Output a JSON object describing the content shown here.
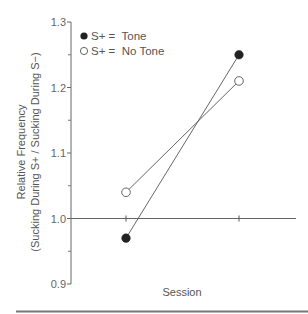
{
  "chart_data": {
    "type": "line",
    "title": "",
    "xlabel": "Session",
    "ylabel": "Relative Frequency",
    "ylabel_sub": "(Sucking During S+ / Sucking During S−)",
    "ylim": [
      0.9,
      1.3
    ],
    "yticks": [
      "0.9",
      "1.0",
      "1.1",
      "1.2",
      "1.3"
    ],
    "y_minor_ticks": [
      0.95,
      1.05,
      1.15,
      1.25
    ],
    "reference_line": 1.0,
    "x": [
      1,
      2
    ],
    "xticks": [
      "",
      ""
    ],
    "grid": false,
    "legend_position": "upper-left",
    "series": [
      {
        "name": "S+ =  Tone",
        "marker": "filled-circle",
        "values": [
          0.97,
          1.25
        ]
      },
      {
        "name": "S+ =  No Tone",
        "marker": "open-circle",
        "values": [
          1.04,
          1.21
        ]
      }
    ]
  },
  "colors": {
    "axis": "#666666",
    "line": "#555555",
    "filled_marker": "#222222",
    "open_marker_fill": "#ffffff",
    "bottom_rule": "#777777"
  }
}
